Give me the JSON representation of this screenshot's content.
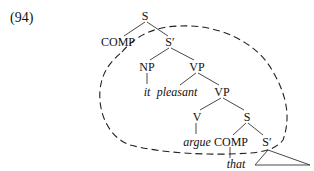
{
  "example": {
    "number": "(94)"
  },
  "tree": {
    "nodes": {
      "s_root": "S",
      "comp_1": "COMP",
      "sbar_1": "S′",
      "np": "NP",
      "it": "it",
      "vp_1": "VP",
      "pleasant": "pleasant",
      "vp_2": "VP",
      "v": "V",
      "argue": "argue",
      "s_2": "S",
      "comp_2": "COMP",
      "that": "that",
      "sbar_2": "S′"
    },
    "edges": [
      [
        "s_root",
        "comp_1"
      ],
      [
        "s_root",
        "sbar_1"
      ],
      [
        "sbar_1",
        "np"
      ],
      [
        "sbar_1",
        "vp_1"
      ],
      [
        "np",
        "it"
      ],
      [
        "vp_1",
        "pleasant"
      ],
      [
        "vp_1",
        "vp_2"
      ],
      [
        "vp_2",
        "v"
      ],
      [
        "vp_2",
        "s_2"
      ],
      [
        "v",
        "argue"
      ],
      [
        "s_2",
        "comp_2"
      ],
      [
        "s_2",
        "sbar_2"
      ],
      [
        "comp_2",
        "that"
      ]
    ],
    "annotations": {
      "dashed_region": "encircles S′ domain from S′ down to embedded S′",
      "triangle": "unexpanded subtree under lower S′"
    }
  }
}
